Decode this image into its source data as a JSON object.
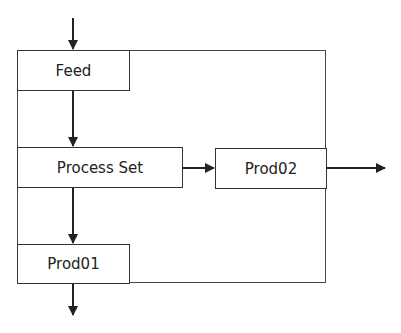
{
  "diagram": {
    "type": "flow",
    "nodes": [
      {
        "id": "feed",
        "label": "Feed"
      },
      {
        "id": "process_set",
        "label": "Process Set"
      },
      {
        "id": "prod02",
        "label": "Prod02"
      },
      {
        "id": "prod01",
        "label": "Prod01"
      }
    ],
    "edges": [
      {
        "from": "input",
        "to": "feed"
      },
      {
        "from": "feed",
        "to": "process_set"
      },
      {
        "from": "process_set",
        "to": "prod02"
      },
      {
        "from": "process_set",
        "to": "prod01"
      },
      {
        "from": "prod02",
        "to": "output"
      },
      {
        "from": "prod01",
        "to": "output"
      }
    ],
    "colors": {
      "line": "#222222",
      "background": "#ffffff"
    }
  }
}
